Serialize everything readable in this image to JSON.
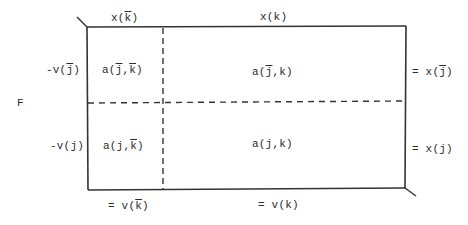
{
  "diagram": {
    "side_label": "F",
    "column_headers": [
      {
        "id": "kbar",
        "text": "x(k̄)",
        "prefix": "x(",
        "var": "k",
        "overbar": true,
        "suffix": ")"
      },
      {
        "id": "k",
        "text": "x(k)",
        "prefix": "x(",
        "var": "k",
        "overbar": false,
        "suffix": ")"
      }
    ],
    "row_headers": [
      {
        "id": "jbar",
        "text": "-v(j̄)",
        "prefix": "-v(",
        "var": "j",
        "overbar": true,
        "suffix": ")"
      },
      {
        "id": "j",
        "text": "-v(j)",
        "prefix": "-v(",
        "var": "j",
        "overbar": false,
        "suffix": ")"
      }
    ],
    "cells": [
      {
        "row": "jbar",
        "col": "kbar",
        "text": "a(j̄,k̄)"
      },
      {
        "row": "jbar",
        "col": "k",
        "text": "a(j̄,k)"
      },
      {
        "row": "j",
        "col": "kbar",
        "text": "a(j,k̄)"
      },
      {
        "row": "j",
        "col": "k",
        "text": "a(j,k)"
      }
    ],
    "row_totals": [
      {
        "row": "jbar",
        "text": "= x(j̄)"
      },
      {
        "row": "j",
        "text": "= x(j)"
      }
    ],
    "column_totals": [
      {
        "col": "kbar",
        "text": "= v(k̄)"
      },
      {
        "col": "k",
        "text": "= v(k)"
      }
    ],
    "line_color": "#333333"
  }
}
